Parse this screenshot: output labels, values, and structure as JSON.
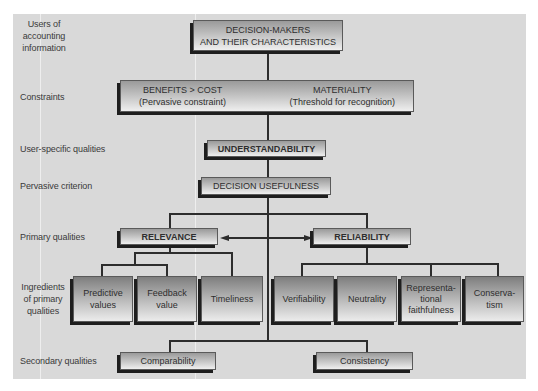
{
  "row_labels": {
    "users": "Users of\naccounting\ninformation",
    "users_lines": [
      "Users of",
      "accounting",
      "information"
    ],
    "constraints": "Constraints",
    "user_specific": "User-specific qualities",
    "pervasive": "Pervasive criterion",
    "primary": "Primary qualities",
    "ingredients_lines": [
      "Ingredients",
      "of primary",
      "qualities"
    ],
    "secondary": "Secondary qualities"
  },
  "nodes": {
    "decision_makers": {
      "lines": [
        "DECISION-MAKERS",
        "AND THEIR CHARACTERISTICS"
      ]
    },
    "constraints": {
      "benefits": {
        "title": "BENEFITS > COST",
        "sub": "(Pervasive constraint)"
      },
      "materiality": {
        "title": "MATERIALITY",
        "sub": "(Threshold for recognition)"
      }
    },
    "understandability": "UNDERSTANDABILITY",
    "decision_usefulness": "DECISION USEFULNESS",
    "relevance": "RELEVANCE",
    "reliability": "RELIABILITY",
    "relevance_ingredients": [
      {
        "lines": [
          "Predictive",
          "values"
        ]
      },
      {
        "lines": [
          "Feedback",
          "value"
        ]
      },
      {
        "lines": [
          "Timeliness"
        ]
      }
    ],
    "reliability_ingredients": [
      {
        "lines": [
          "Verifiability"
        ]
      },
      {
        "lines": [
          "Neutrality"
        ]
      },
      {
        "lines": [
          "Representa-",
          "tional",
          "faithfulness"
        ]
      },
      {
        "lines": [
          "Conserva-",
          "tism"
        ]
      }
    ],
    "secondary": [
      "Comparability",
      "Consistency"
    ]
  },
  "colors": {
    "panel": "#d9d9d9",
    "line": "#2d2d2d",
    "shadow": "#1e1e1e",
    "text": "#2e2e2e"
  }
}
